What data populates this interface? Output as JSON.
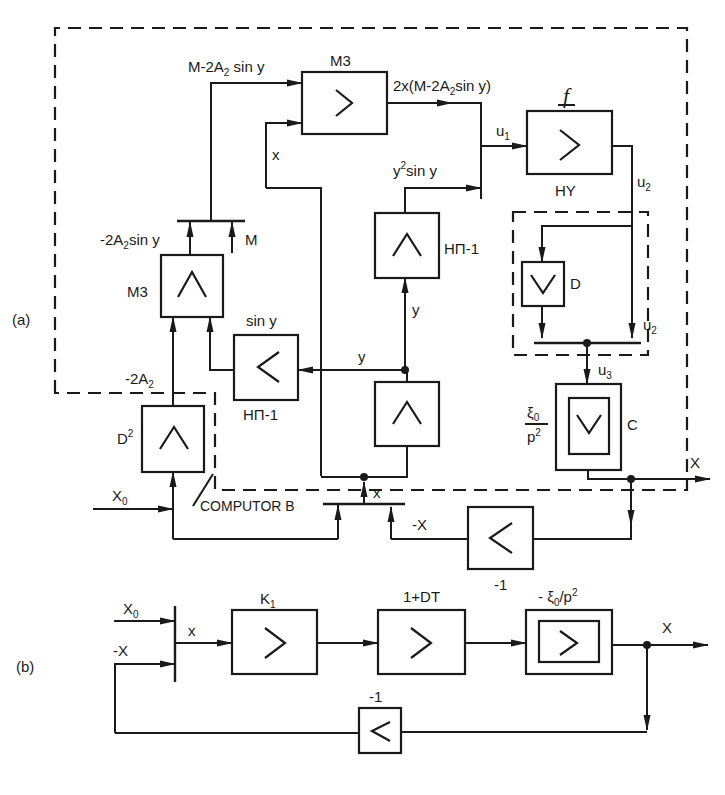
{
  "figure": {
    "panel_a_label": "(a)",
    "panel_b_label": "(b)",
    "computer_label": "COMPUTOR B"
  },
  "panel_a": {
    "blocks": {
      "m3_top": {
        "label_above": "M3",
        "symbol": ">",
        "type": "multiplier"
      },
      "hy": {
        "label_above": "f",
        "label_below": "HY",
        "symbol": ">",
        "type": "function"
      },
      "hpi_upper": {
        "label_right": "HΠ-1",
        "symbol": "∧",
        "type": "function"
      },
      "m3_left": {
        "label_left": "M3",
        "symbol": "∧",
        "type": "multiplier"
      },
      "sin_block": {
        "label_above": "sin y",
        "label_below": "HΠ-1",
        "symbol": "<",
        "type": "function"
      },
      "lower_wedge": {
        "symbol": "∧",
        "type": "integrator"
      },
      "d_block": {
        "label_right": "D",
        "symbol": "∨",
        "type": "differentiator"
      },
      "c_block": {
        "label_left_num": "ξ0",
        "label_left_den": "p2",
        "label_right": "C",
        "symbol": "∨",
        "type": "double-integrator"
      },
      "d2_block": {
        "label_left": "D2",
        "symbol": "∧",
        "type": "function"
      },
      "inv_block": {
        "label_below": "-1",
        "symbol": "<",
        "type": "inverter"
      }
    },
    "signals": {
      "m_minus": "M-2A2 sin y",
      "product": "2x(M-2A2sin y)",
      "u1": "u1",
      "u2_top": "u2",
      "u2_inner": "u2",
      "u3": "u3",
      "y2siny": "y2sin y",
      "neg2a2siny": "-2A2sin y",
      "m_input": "M",
      "neg2a2": "-2A2",
      "x_m3": "x",
      "y_vertical": "y",
      "y_horizontal": "y",
      "x_sum": "x",
      "x0": "X0",
      "neg_x": "-X",
      "x_out": "X"
    }
  },
  "panel_b": {
    "blocks": {
      "k1": {
        "label_above": "K1",
        "symbol": ">"
      },
      "lead": {
        "label_above": "1+DT",
        "symbol": ">"
      },
      "plant": {
        "label_above": "- ξ0/p2",
        "symbol": ">"
      },
      "inv": {
        "label_above": "-1",
        "symbol": "<"
      }
    },
    "signals": {
      "x0": "X0",
      "neg_x": "-X",
      "x_sum": "x",
      "x_out": "X"
    }
  }
}
